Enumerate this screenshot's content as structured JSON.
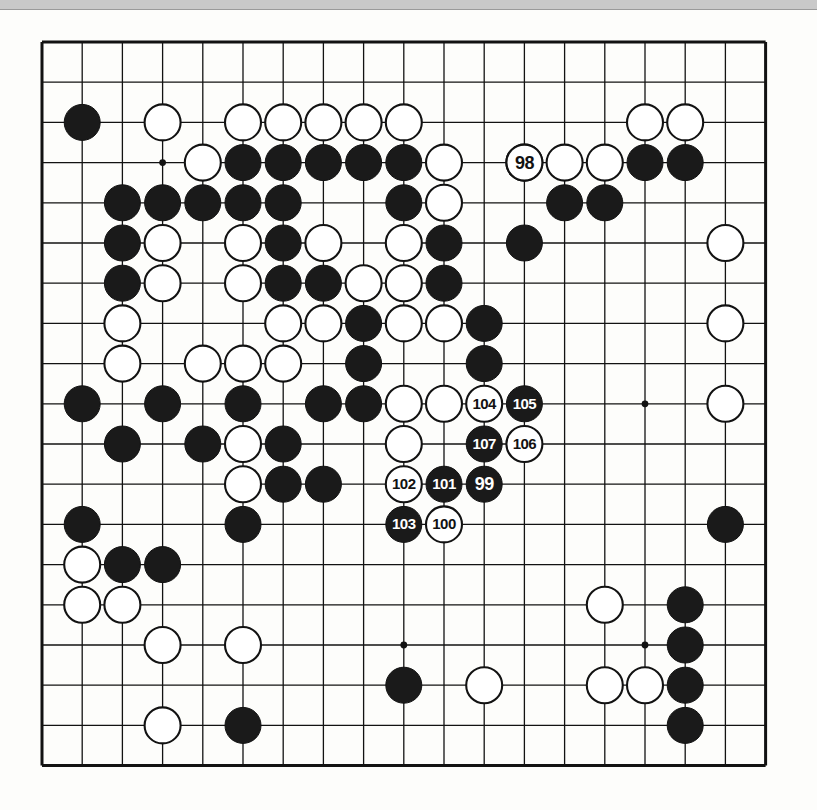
{
  "diagram": {
    "type": "go-board-diagram",
    "board_size": 19,
    "colors": {
      "board_background": "#fdfdfb",
      "grid_line": "#121212",
      "black_stone": "#1a1a1a",
      "white_stone": "#ffffff",
      "stone_outline": "#121212",
      "scan_bar": "#c9c9c9"
    },
    "geometry": {
      "origin_x": 42,
      "origin_y": 42,
      "spacing": 40.2,
      "stone_radius": 18,
      "border_thickness": 3
    },
    "star_points": [
      {
        "col": 4,
        "row": 4
      },
      {
        "col": 10,
        "row": 4
      },
      {
        "col": 16,
        "row": 4
      },
      {
        "col": 4,
        "row": 10
      },
      {
        "col": 10,
        "row": 10
      },
      {
        "col": 16,
        "row": 10
      },
      {
        "col": 4,
        "row": 16
      },
      {
        "col": 10,
        "row": 16
      },
      {
        "col": 16,
        "row": 16
      }
    ],
    "stones": [
      {
        "col": 2,
        "row": 3,
        "color": "black"
      },
      {
        "col": 4,
        "row": 3,
        "color": "white"
      },
      {
        "col": 6,
        "row": 3,
        "color": "white"
      },
      {
        "col": 7,
        "row": 3,
        "color": "white"
      },
      {
        "col": 8,
        "row": 3,
        "color": "white"
      },
      {
        "col": 9,
        "row": 3,
        "color": "white"
      },
      {
        "col": 10,
        "row": 3,
        "color": "white"
      },
      {
        "col": 16,
        "row": 3,
        "color": "white"
      },
      {
        "col": 17,
        "row": 3,
        "color": "white"
      },
      {
        "col": 5,
        "row": 4,
        "color": "white"
      },
      {
        "col": 6,
        "row": 4,
        "color": "black"
      },
      {
        "col": 7,
        "row": 4,
        "color": "black"
      },
      {
        "col": 8,
        "row": 4,
        "color": "black"
      },
      {
        "col": 9,
        "row": 4,
        "color": "black"
      },
      {
        "col": 10,
        "row": 4,
        "color": "black"
      },
      {
        "col": 11,
        "row": 4,
        "color": "white"
      },
      {
        "col": 13,
        "row": 4,
        "color": "white"
      },
      {
        "col": 14,
        "row": 4,
        "color": "white"
      },
      {
        "col": 15,
        "row": 4,
        "color": "white"
      },
      {
        "col": 16,
        "row": 4,
        "color": "black"
      },
      {
        "col": 17,
        "row": 4,
        "color": "black"
      },
      {
        "col": 3,
        "row": 5,
        "color": "black"
      },
      {
        "col": 4,
        "row": 5,
        "color": "black"
      },
      {
        "col": 5,
        "row": 5,
        "color": "black"
      },
      {
        "col": 6,
        "row": 5,
        "color": "black"
      },
      {
        "col": 7,
        "row": 5,
        "color": "black"
      },
      {
        "col": 10,
        "row": 5,
        "color": "black"
      },
      {
        "col": 11,
        "row": 5,
        "color": "white"
      },
      {
        "col": 14,
        "row": 5,
        "color": "black"
      },
      {
        "col": 15,
        "row": 5,
        "color": "black"
      },
      {
        "col": 3,
        "row": 6,
        "color": "black"
      },
      {
        "col": 4,
        "row": 6,
        "color": "white"
      },
      {
        "col": 6,
        "row": 6,
        "color": "white"
      },
      {
        "col": 7,
        "row": 6,
        "color": "black"
      },
      {
        "col": 8,
        "row": 6,
        "color": "white"
      },
      {
        "col": 10,
        "row": 6,
        "color": "white"
      },
      {
        "col": 11,
        "row": 6,
        "color": "black"
      },
      {
        "col": 13,
        "row": 6,
        "color": "black"
      },
      {
        "col": 18,
        "row": 6,
        "color": "white"
      },
      {
        "col": 3,
        "row": 7,
        "color": "black"
      },
      {
        "col": 4,
        "row": 7,
        "color": "white"
      },
      {
        "col": 6,
        "row": 7,
        "color": "white"
      },
      {
        "col": 7,
        "row": 7,
        "color": "black"
      },
      {
        "col": 8,
        "row": 7,
        "color": "black"
      },
      {
        "col": 9,
        "row": 7,
        "color": "white"
      },
      {
        "col": 10,
        "row": 7,
        "color": "white"
      },
      {
        "col": 11,
        "row": 7,
        "color": "black"
      },
      {
        "col": 3,
        "row": 8,
        "color": "white"
      },
      {
        "col": 7,
        "row": 8,
        "color": "white"
      },
      {
        "col": 8,
        "row": 8,
        "color": "white"
      },
      {
        "col": 9,
        "row": 8,
        "color": "black"
      },
      {
        "col": 10,
        "row": 8,
        "color": "white"
      },
      {
        "col": 11,
        "row": 8,
        "color": "white"
      },
      {
        "col": 12,
        "row": 8,
        "color": "black"
      },
      {
        "col": 18,
        "row": 8,
        "color": "white"
      },
      {
        "col": 3,
        "row": 9,
        "color": "white"
      },
      {
        "col": 5,
        "row": 9,
        "color": "white"
      },
      {
        "col": 6,
        "row": 9,
        "color": "white"
      },
      {
        "col": 7,
        "row": 9,
        "color": "white"
      },
      {
        "col": 9,
        "row": 9,
        "color": "black"
      },
      {
        "col": 12,
        "row": 9,
        "color": "black"
      },
      {
        "col": 2,
        "row": 10,
        "color": "black"
      },
      {
        "col": 4,
        "row": 10,
        "color": "black"
      },
      {
        "col": 6,
        "row": 10,
        "color": "black"
      },
      {
        "col": 8,
        "row": 10,
        "color": "black"
      },
      {
        "col": 9,
        "row": 10,
        "color": "black"
      },
      {
        "col": 10,
        "row": 10,
        "color": "white"
      },
      {
        "col": 11,
        "row": 10,
        "color": "white"
      },
      {
        "col": 18,
        "row": 10,
        "color": "white"
      },
      {
        "col": 3,
        "row": 11,
        "color": "black"
      },
      {
        "col": 5,
        "row": 11,
        "color": "black"
      },
      {
        "col": 6,
        "row": 11,
        "color": "white"
      },
      {
        "col": 7,
        "row": 11,
        "color": "black"
      },
      {
        "col": 10,
        "row": 11,
        "color": "white"
      },
      {
        "col": 6,
        "row": 12,
        "color": "white"
      },
      {
        "col": 7,
        "row": 12,
        "color": "black"
      },
      {
        "col": 8,
        "row": 12,
        "color": "black"
      },
      {
        "col": 2,
        "row": 13,
        "color": "black"
      },
      {
        "col": 6,
        "row": 13,
        "color": "black"
      },
      {
        "col": 18,
        "row": 13,
        "color": "black"
      },
      {
        "col": 2,
        "row": 14,
        "color": "white"
      },
      {
        "col": 3,
        "row": 14,
        "color": "black"
      },
      {
        "col": 4,
        "row": 14,
        "color": "black"
      },
      {
        "col": 2,
        "row": 15,
        "color": "white"
      },
      {
        "col": 3,
        "row": 15,
        "color": "white"
      },
      {
        "col": 15,
        "row": 15,
        "color": "white"
      },
      {
        "col": 17,
        "row": 15,
        "color": "black"
      },
      {
        "col": 4,
        "row": 16,
        "color": "white"
      },
      {
        "col": 6,
        "row": 16,
        "color": "white"
      },
      {
        "col": 17,
        "row": 16,
        "color": "black"
      },
      {
        "col": 10,
        "row": 17,
        "color": "black"
      },
      {
        "col": 12,
        "row": 17,
        "color": "white"
      },
      {
        "col": 15,
        "row": 17,
        "color": "white"
      },
      {
        "col": 16,
        "row": 17,
        "color": "white"
      },
      {
        "col": 17,
        "row": 17,
        "color": "black"
      },
      {
        "col": 4,
        "row": 18,
        "color": "white"
      },
      {
        "col": 6,
        "row": 18,
        "color": "black"
      },
      {
        "col": 17,
        "row": 18,
        "color": "black"
      }
    ],
    "numbered_moves": [
      {
        "number": "98",
        "col": 13,
        "row": 4,
        "color": "white"
      },
      {
        "number": "99",
        "col": 12,
        "row": 12,
        "color": "black"
      },
      {
        "number": "100",
        "col": 11,
        "row": 13,
        "color": "white"
      },
      {
        "number": "101",
        "col": 11,
        "row": 12,
        "color": "black"
      },
      {
        "number": "102",
        "col": 10,
        "row": 12,
        "color": "white"
      },
      {
        "number": "103",
        "col": 10,
        "row": 13,
        "color": "black"
      },
      {
        "number": "104",
        "col": 12,
        "row": 10,
        "color": "white"
      },
      {
        "number": "105",
        "col": 13,
        "row": 10,
        "color": "black"
      },
      {
        "number": "106",
        "col": 13,
        "row": 11,
        "color": "white"
      },
      {
        "number": "107",
        "col": 12,
        "row": 11,
        "color": "black"
      }
    ]
  }
}
